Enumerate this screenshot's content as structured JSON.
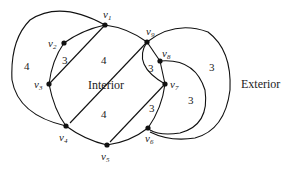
{
  "figure": {
    "vertices": [
      {
        "id": "v1",
        "base": "v",
        "sub": "1"
      },
      {
        "id": "v2",
        "base": "v",
        "sub": "2"
      },
      {
        "id": "v3",
        "base": "v",
        "sub": "3"
      },
      {
        "id": "v4",
        "base": "v",
        "sub": "4"
      },
      {
        "id": "v5",
        "base": "v",
        "sub": "5"
      },
      {
        "id": "v6",
        "base": "v",
        "sub": "6"
      },
      {
        "id": "v7",
        "base": "v",
        "sub": "7"
      },
      {
        "id": "v8",
        "base": "v",
        "sub": "8"
      },
      {
        "id": "v9",
        "base": "v",
        "sub": "9"
      }
    ],
    "edges": [
      {
        "from": "v1",
        "to": "v2"
      },
      {
        "from": "v2",
        "to": "v3"
      },
      {
        "from": "v1",
        "to": "v3"
      },
      {
        "from": "v3",
        "to": "v4"
      },
      {
        "from": "v1",
        "to": "v4",
        "note": "outer arc on left"
      },
      {
        "from": "v4",
        "to": "v5"
      },
      {
        "from": "v4",
        "to": "v9"
      },
      {
        "from": "v5",
        "to": "v6"
      },
      {
        "from": "v5",
        "to": "v7"
      },
      {
        "from": "v6",
        "to": "v7"
      },
      {
        "from": "v7",
        "to": "v8"
      },
      {
        "from": "v7",
        "to": "v9"
      },
      {
        "from": "v8",
        "to": "v9"
      },
      {
        "from": "v1",
        "to": "v9"
      },
      {
        "from": "v8",
        "to": "v6",
        "note": "outer arc on right"
      },
      {
        "from": "v9",
        "to": "v6",
        "note": "outermost arc on right"
      }
    ],
    "face_weights": [
      {
        "face": "v1-v2-v3",
        "label": "3"
      },
      {
        "face": "v1-v3-v4-v9",
        "label": "4"
      },
      {
        "face": "left-outer",
        "label": "4"
      },
      {
        "face": "v4-v5-v9-lower",
        "label": "4"
      },
      {
        "face": "v7-v8-v9",
        "label": "3"
      },
      {
        "face": "v5-v6-v7",
        "label": "3"
      },
      {
        "face": "v6-v7-v8-arc",
        "label": "3"
      },
      {
        "face": "v6-v8-v9-arc",
        "label": "3"
      }
    ],
    "regions": {
      "interior": "Interior",
      "exterior": "Exterior"
    }
  }
}
